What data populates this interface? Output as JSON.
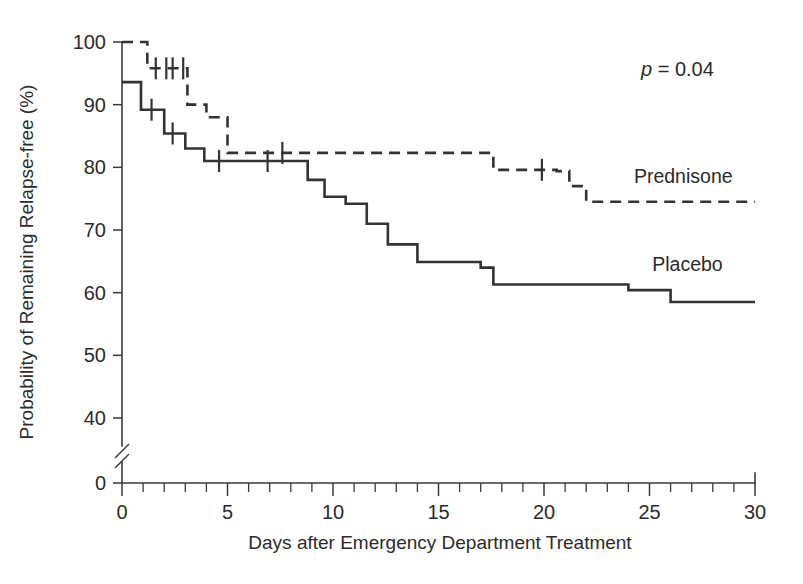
{
  "chart_data": {
    "type": "line",
    "subtype": "kaplan-meier-step",
    "title": "",
    "xlabel": "Days after Emergency Department Treatment",
    "ylabel": "Probability of Remaining Relapse-free (%)",
    "xlim": [
      0,
      30
    ],
    "ylim": [
      40,
      100
    ],
    "y_axis_break": true,
    "y_axis_break_note": "axis broken between 40 and 0",
    "y_zero_shown": true,
    "grid": false,
    "legend_position": "inline-right",
    "xticks": [
      0,
      1,
      2,
      3,
      4,
      5,
      6,
      7,
      8,
      9,
      10,
      11,
      12,
      13,
      14,
      15,
      16,
      17,
      18,
      19,
      20,
      21,
      22,
      23,
      24,
      25,
      26,
      27,
      28,
      29,
      30
    ],
    "xtick_labels": [
      "0",
      "5",
      "10",
      "15",
      "20",
      "25",
      "30"
    ],
    "xtick_label_values": [
      0,
      5,
      10,
      15,
      20,
      25,
      30
    ],
    "yticks": [
      40,
      50,
      60,
      70,
      80,
      90,
      100
    ],
    "ytick_labels": [
      "40",
      "50",
      "60",
      "70",
      "80",
      "90",
      "100"
    ],
    "y_zero_label": "0",
    "annotations": [
      {
        "name": "p-value",
        "text_italic": "p",
        "text_rest": " = 0.04",
        "x": 23.0,
        "y": 97.0
      }
    ],
    "series": [
      {
        "name": "Prednisone",
        "style": "dashed",
        "label": "Prednisone",
        "label_x": 26.6,
        "label_y": 77.5,
        "points": [
          [
            0.0,
            100.0
          ],
          [
            1.2,
            100.0
          ],
          [
            1.2,
            95.8
          ],
          [
            3.1,
            95.8
          ],
          [
            3.1,
            90.0
          ],
          [
            4.0,
            90.0
          ],
          [
            4.0,
            88.0
          ],
          [
            5.0,
            88.0
          ],
          [
            5.0,
            82.3
          ],
          [
            12.0,
            82.3
          ],
          [
            12.0,
            82.3
          ],
          [
            17.6,
            82.3
          ],
          [
            17.6,
            79.6
          ],
          [
            20.6,
            79.6
          ],
          [
            20.6,
            79.4
          ],
          [
            21.2,
            79.4
          ],
          [
            21.2,
            77.0
          ],
          [
            22.0,
            77.0
          ],
          [
            22.0,
            74.5
          ],
          [
            30.0,
            74.5
          ]
        ],
        "censored": [
          [
            1.6,
            95.8
          ],
          [
            2.1,
            95.8
          ],
          [
            2.4,
            95.8
          ],
          [
            2.9,
            95.8
          ],
          [
            7.6,
            82.3
          ],
          [
            19.9,
            79.6
          ]
        ]
      },
      {
        "name": "Placebo",
        "style": "solid",
        "label": "Placebo",
        "label_x": 26.8,
        "label_y": 63.5,
        "points": [
          [
            0.0,
            93.6
          ],
          [
            0.9,
            93.6
          ],
          [
            0.9,
            89.2
          ],
          [
            2.0,
            89.2
          ],
          [
            2.0,
            85.4
          ],
          [
            3.0,
            85.4
          ],
          [
            3.0,
            83.0
          ],
          [
            3.9,
            83.0
          ],
          [
            3.9,
            81.0
          ],
          [
            7.6,
            81.0
          ],
          [
            7.6,
            81.0
          ],
          [
            8.8,
            81.0
          ],
          [
            8.8,
            78.0
          ],
          [
            9.6,
            78.0
          ],
          [
            9.6,
            75.3
          ],
          [
            10.6,
            75.3
          ],
          [
            10.6,
            74.2
          ],
          [
            11.6,
            74.2
          ],
          [
            11.6,
            71.0
          ],
          [
            12.6,
            71.0
          ],
          [
            12.6,
            67.7
          ],
          [
            14.0,
            67.7
          ],
          [
            14.0,
            64.9
          ],
          [
            17.0,
            64.9
          ],
          [
            17.0,
            64.0
          ],
          [
            17.6,
            64.0
          ],
          [
            17.6,
            61.3
          ],
          [
            24.0,
            61.3
          ],
          [
            24.0,
            60.4
          ],
          [
            26.0,
            60.4
          ],
          [
            26.0,
            58.5
          ],
          [
            30.0,
            58.5
          ]
        ],
        "censored": [
          [
            1.4,
            89.2
          ],
          [
            2.4,
            85.4
          ],
          [
            4.6,
            81.0
          ],
          [
            6.9,
            81.0
          ]
        ]
      }
    ]
  },
  "figure": {
    "xlabel": "Days after Emergency Department Treatment",
    "ylabel": "Probability of Remaining Relapse-free (%)",
    "pvalue_italic": "p",
    "pvalue_rest": " = 0.04",
    "prednisone_label": "Prednisone",
    "placebo_label": "Placebo",
    "colors": {
      "ink": "#333333",
      "axis": "#3a3a3a",
      "background": "#ffffff"
    }
  }
}
